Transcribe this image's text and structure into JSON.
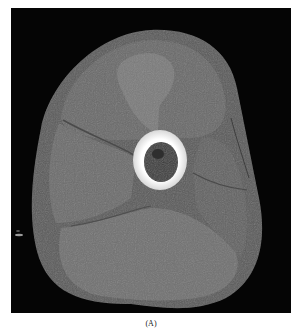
{
  "figure": {
    "caption": "(A)",
    "image_description": "Axial CT scan cross-section of a thigh showing femur with cortical bone ring surrounded by muscle and subcutaneous fat",
    "colors": {
      "background": "#050505",
      "outer_fat": "#5a5a5a",
      "muscle": "#6e6e6e",
      "bone": "#f2f2f2",
      "marrow": "#3a3a3a",
      "lesion": "#878787"
    }
  }
}
